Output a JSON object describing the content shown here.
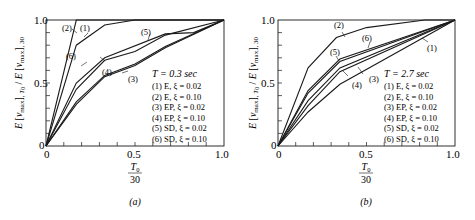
{
  "chart_data": [
    {
      "type": "line",
      "panel_label": "(a)",
      "title": "T = 0.3 sec",
      "xlabel_num": "T0",
      "xlabel_den": "30",
      "ylabel": "E[vmax],T0 / E[vmax],30",
      "xlim": [
        0,
        1.0
      ],
      "ylim": [
        0,
        1.0
      ],
      "x_ticks": [
        "0",
        "0.5",
        "1.0"
      ],
      "y_ticks": [
        "0",
        "0.5",
        "1.0"
      ],
      "grid": false,
      "legend_position": "inside lower right",
      "series": [
        {
          "id": "1",
          "name": "(1) E, ξ = 0.02",
          "x": [
            0,
            0.17,
            0.33,
            0.5,
            1.0
          ],
          "y": [
            0,
            0.8,
            0.96,
            1.0,
            1.0
          ]
        },
        {
          "id": "2",
          "name": "(2) E, ξ = 0.10",
          "x": [
            0,
            0.17,
            1.0
          ],
          "y": [
            0,
            1.0,
            1.0
          ]
        },
        {
          "id": "3",
          "name": "(3) EP, ξ = 0.02",
          "x": [
            0,
            0.17,
            0.33,
            0.5,
            0.67,
            1.0
          ],
          "y": [
            0,
            0.33,
            0.55,
            0.64,
            0.78,
            1.0
          ]
        },
        {
          "id": "4",
          "name": "(4) EP, ξ = 0.10",
          "x": [
            0,
            0.17,
            0.33,
            0.5,
            0.67,
            1.0
          ],
          "y": [
            0,
            0.35,
            0.56,
            0.65,
            0.79,
            1.0
          ]
        },
        {
          "id": "5",
          "name": "(5) SD, ξ = 0.02",
          "x": [
            0,
            0.17,
            0.33,
            0.67,
            0.83,
            1.0
          ],
          "y": [
            0,
            0.5,
            0.7,
            0.89,
            0.9,
            1.0
          ]
        },
        {
          "id": "6",
          "name": "(6) SD, ξ = 0.10",
          "x": [
            0,
            0.17,
            0.33,
            0.5,
            0.67,
            1.0
          ],
          "y": [
            0,
            0.45,
            0.68,
            0.75,
            0.88,
            1.0
          ]
        }
      ],
      "annotations": [
        "(1)",
        "(2)",
        "(3)",
        "(4)",
        "(5)",
        "(6)"
      ]
    },
    {
      "type": "line",
      "panel_label": "(b)",
      "title": "T = 2.7 sec",
      "xlabel_num": "T0",
      "xlabel_den": "30",
      "ylabel": "E[vmax],T0 / E[vmax],30",
      "xlim": [
        0,
        1.0
      ],
      "ylim": [
        0,
        1.0
      ],
      "x_ticks": [
        "0",
        "0.5",
        "1.0"
      ],
      "y_ticks": [
        "0",
        "0.5",
        "1.0"
      ],
      "grid": false,
      "legend_position": "inside lower right",
      "series": [
        {
          "id": "1",
          "name": "(1) E, ξ = 0.02",
          "x": [
            0,
            0.17,
            0.35,
            1.0
          ],
          "y": [
            0,
            0.27,
            0.49,
            1.0
          ]
        },
        {
          "id": "2",
          "name": "(2) E, ξ = 0.10",
          "x": [
            0,
            0.17,
            0.33,
            0.5,
            0.83,
            1.0
          ],
          "y": [
            0,
            0.62,
            0.86,
            0.94,
            1.0,
            1.0
          ]
        },
        {
          "id": "3",
          "name": "(3) EP, ξ = 0.02",
          "x": [
            0,
            0.17,
            0.35,
            1.0
          ],
          "y": [
            0,
            0.32,
            0.59,
            1.0
          ]
        },
        {
          "id": "4",
          "name": "(4) EP, ξ = 0.10",
          "x": [
            0,
            0.17,
            0.35,
            1.0
          ],
          "y": [
            0,
            0.36,
            0.62,
            1.0
          ]
        },
        {
          "id": "5",
          "name": "(5) SD, ξ = 0.02",
          "x": [
            0,
            0.17,
            0.35,
            1.0
          ],
          "y": [
            0,
            0.44,
            0.69,
            1.0
          ]
        },
        {
          "id": "6",
          "name": "(6) SD, ξ = 0.10",
          "x": [
            0,
            0.17,
            0.35,
            1.0
          ],
          "y": [
            0,
            0.42,
            0.67,
            1.0
          ]
        }
      ],
      "annotations": [
        "(1)",
        "(2)",
        "(3)",
        "(4)",
        "(5)",
        "(6)"
      ]
    }
  ],
  "panels": [
    {
      "label": "(a)",
      "legend_title": "T = 0.3 sec",
      "legend": [
        "(1) E, ξ = 0.02",
        "(2) E, ξ = 0.10",
        "(3) EP, ξ = 0.02",
        "(4) EP, ξ = 0.10",
        "(5) SD, ξ = 0.02",
        "(6) SD, ξ = 0.10"
      ],
      "x_ticks": [
        "0",
        "0.5",
        "1.0"
      ],
      "y_ticks": [
        "0",
        "0.5",
        "1.0"
      ],
      "xlabel_num": "T0",
      "xlabel_den": "30"
    },
    {
      "label": "(b)",
      "legend_title": "T = 2.7 sec",
      "legend": [
        "(1) E, ξ = 0.02",
        "(2) E, ξ = 0.10",
        "(3) EP, ξ = 0.02",
        "(4) EP, ξ = 0.10",
        "(5) SD, ξ = 0.02",
        "(6) SD, ξ = 0.10"
      ],
      "x_ticks": [
        "0",
        "0.5",
        "1.0"
      ],
      "y_ticks": [
        "0",
        "0.5",
        "1.0"
      ],
      "xlabel_num": "T0",
      "xlabel_den": "30"
    }
  ]
}
